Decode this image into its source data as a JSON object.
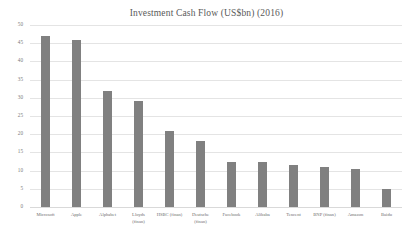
{
  "chart_data": {
    "type": "bar",
    "title": "Investment Cash Flow (US$bn) (2016)",
    "xlabel": "",
    "ylabel": "",
    "ylim": [
      0,
      50
    ],
    "ytick_step": 5,
    "yticks": [
      "50",
      "45",
      "40",
      "35",
      "30",
      "25",
      "20",
      "15",
      "10",
      "5",
      "0"
    ],
    "grid": true,
    "legend": false,
    "bar_color": "#808080",
    "categories": [
      "Microsoft",
      "Apple",
      "Alphabet",
      "Lloyds (finan)",
      "HSBC (finan)",
      "Deutsche (finan)",
      "Facebook",
      "Alibaba",
      "Tencent",
      "BNP (finan)",
      "Amazon",
      "Baidu"
    ],
    "category_lines": [
      [
        "Microsoft"
      ],
      [
        "Apple"
      ],
      [
        "Alphabet"
      ],
      [
        "Lloyds",
        "(finan)"
      ],
      [
        "HSBC (finan)"
      ],
      [
        "Deutsche",
        "(finan)"
      ],
      [
        "Facebook"
      ],
      [
        "Alibaba"
      ],
      [
        "Tencent"
      ],
      [
        "BNP (finan)"
      ],
      [
        "Amazon"
      ],
      [
        "Baidu"
      ]
    ],
    "values": [
      47,
      46,
      32,
      29,
      21,
      18,
      12.5,
      12.5,
      11.5,
      11,
      10.5,
      5
    ]
  }
}
